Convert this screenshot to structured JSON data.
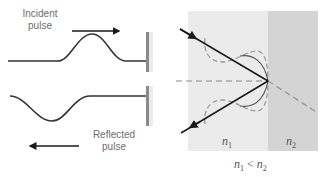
{
  "left_panel": {
    "incident_label_line1": "Incident",
    "incident_label_line2": "pulse",
    "reflected_label_line1": "Reflected",
    "reflected_label_line2": "pulse"
  },
  "right_panel": {
    "medium1_symbol": "n",
    "medium1_sub": "1",
    "medium2_symbol": "n",
    "medium2_sub": "2",
    "relation_left": "n",
    "relation_left_sub": "1",
    "relation_op": " < ",
    "relation_right": "n",
    "relation_right_sub": "2"
  },
  "colors": {
    "medium1": "#ebebeb",
    "medium2": "#d4d4d4",
    "ray": "#1a1a1a",
    "dashed": "#9a9a9a",
    "wall": "#7a7a7a"
  }
}
